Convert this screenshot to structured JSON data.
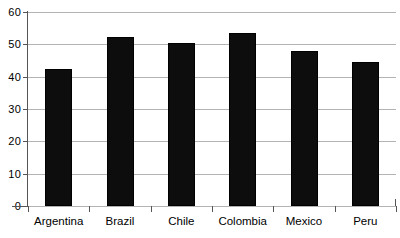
{
  "chart_data": {
    "type": "bar",
    "title": "",
    "subtitle": "",
    "xlabel": "",
    "ylabel": "",
    "categories": [
      "Argentina",
      "Brazil",
      "Chile",
      "Colombia",
      "Mexico",
      "Peru"
    ],
    "values": [
      42.3,
      52.2,
      50.4,
      53.4,
      48.0,
      44.6
    ],
    "ylim": [
      0,
      60
    ],
    "y_ticks": [
      0,
      10,
      20,
      30,
      40,
      50,
      60
    ],
    "y_tick_labels": [
      "0",
      "10",
      "20",
      "30",
      "40",
      "50",
      "60"
    ],
    "grid": "horizontal",
    "legend": "none",
    "bar_color": "#0d0d0d",
    "gridline_color": "#b3b3b3",
    "axis_color": "#555555",
    "background_color": "#ffffff"
  }
}
